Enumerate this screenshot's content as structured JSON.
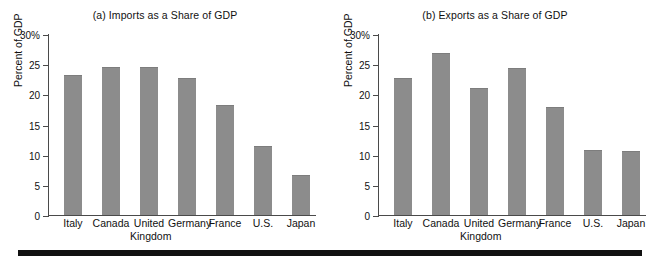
{
  "figure": {
    "rule_color": "#111111",
    "bar_color": "#8c8c8c"
  },
  "chart_data": [
    {
      "type": "bar",
      "title": "(a) Imports as a Share of GDP",
      "xlabel": "",
      "ylabel": "Percent of GDP",
      "ylim": [
        0,
        30
      ],
      "yticks": [
        0,
        5,
        10,
        15,
        20,
        25,
        30
      ],
      "ytick_labels": [
        "0",
        "5",
        "10",
        "15",
        "20",
        "25",
        "30%"
      ],
      "grid": false,
      "legend": "none",
      "categories": [
        "Italy",
        "Canada",
        "United Kingdom",
        "Germany",
        "France",
        "U.S.",
        "Japan"
      ],
      "category_lines": [
        [
          "Italy",
          ""
        ],
        [
          "Canada",
          ""
        ],
        [
          "United",
          "Kingdom"
        ],
        [
          "Germany",
          ""
        ],
        [
          "France",
          ""
        ],
        [
          "U.S.",
          ""
        ],
        [
          "Japan",
          ""
        ]
      ],
      "values": [
        23.2,
        24.5,
        24.6,
        22.7,
        18.3,
        11.4,
        6.7
      ]
    },
    {
      "type": "bar",
      "title": "(b) Exports as a Share of GDP",
      "xlabel": "",
      "ylabel": "Percent of GDP",
      "ylim": [
        0,
        30
      ],
      "yticks": [
        0,
        5,
        10,
        15,
        20,
        25,
        30
      ],
      "ytick_labels": [
        "0",
        "5",
        "10",
        "15",
        "20",
        "25",
        "30%"
      ],
      "grid": false,
      "legend": "none",
      "categories": [
        "Italy",
        "Canada",
        "United Kingdom",
        "Germany",
        "France",
        "U.S.",
        "Japan"
      ],
      "category_lines": [
        [
          "Italy",
          ""
        ],
        [
          "Canada",
          ""
        ],
        [
          "United",
          "Kingdom"
        ],
        [
          "Germany",
          ""
        ],
        [
          "France",
          ""
        ],
        [
          "U.S.",
          ""
        ],
        [
          "Japan",
          ""
        ]
      ],
      "values": [
        22.7,
        26.8,
        21.1,
        24.3,
        17.9,
        10.8,
        10.6
      ]
    }
  ]
}
